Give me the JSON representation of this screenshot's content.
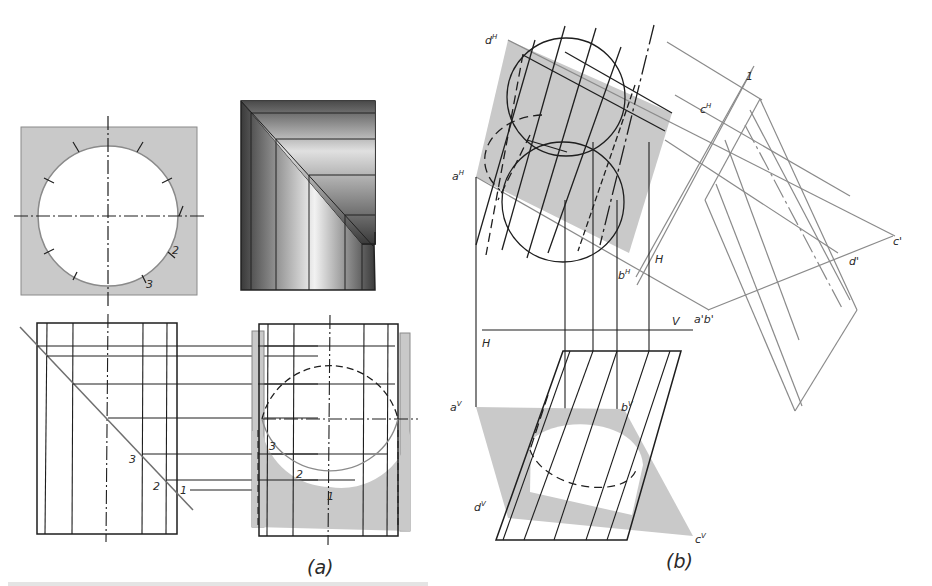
{
  "figure": {
    "panel_a": {
      "caption": "(a)",
      "point_labels": [
        "1",
        "2",
        "3"
      ],
      "top_view_labels": [
        "1",
        "2",
        "3"
      ],
      "side_view_labels": [
        "1",
        "2",
        "3"
      ],
      "front_view_labels": [
        "1",
        "2",
        "3"
      ]
    },
    "panel_b": {
      "caption": "(b)",
      "labels": {
        "dH": "d",
        "dH_sup": "H",
        "aH": "a",
        "aH_sup": "H",
        "cH": "c",
        "cH_sup": "H",
        "bH": "b",
        "bH_sup": "H",
        "H_upper": "H",
        "c1": "c'",
        "d1": "d'",
        "a1b1": "a'b'",
        "fold_line_1": "1",
        "V": "V",
        "H_lower": "H",
        "aV": "a",
        "aV_sup": "V",
        "bV": "b",
        "bV_sup": "V",
        "dV": "d",
        "dV_sup": "V",
        "cV": "c",
        "cV_sup": "V"
      }
    },
    "colors": {
      "line": "#1e1e1e",
      "light_line": "#7a7a7a",
      "shade": "#c8c8c8",
      "background": "#ffffff"
    }
  }
}
